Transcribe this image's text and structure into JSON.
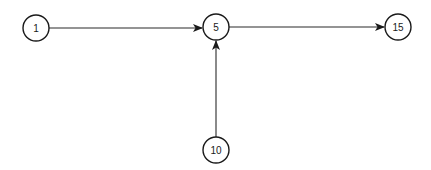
{
  "diagram": {
    "type": "directed-graph",
    "nodes": [
      {
        "id": "n1",
        "label": "1",
        "x": 36,
        "y": 28
      },
      {
        "id": "n5",
        "label": "5",
        "x": 216,
        "y": 27
      },
      {
        "id": "n15",
        "label": "15",
        "x": 398,
        "y": 27
      },
      {
        "id": "n10",
        "label": "10",
        "x": 216,
        "y": 150
      }
    ],
    "edges": [
      {
        "from": "1",
        "to": "5"
      },
      {
        "from": "5",
        "to": "15"
      },
      {
        "from": "10",
        "to": "5"
      }
    ],
    "colors": {
      "stroke": "#1a1a1a",
      "background": "#ffffff"
    }
  }
}
